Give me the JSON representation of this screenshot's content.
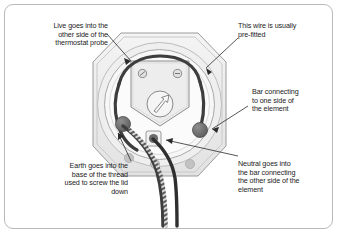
{
  "figure": {
    "frame_color": "#b9b9b9",
    "background": "#ffffff",
    "wire_color": "#4a4a4a",
    "plate_color": "#e8e8e8",
    "text_color": "#1b1b1b"
  },
  "callouts": [
    {
      "id": "live",
      "align": "right",
      "lines": [
        "Live goes into the",
        "other side of the",
        "thermostat probe"
      ],
      "text": "Live goes into the\nother side of the\nthermostat probe"
    },
    {
      "id": "prefitted",
      "align": "left",
      "lines": [
        "This wire is usually",
        "pre-fitted"
      ],
      "text": "This wire is usually\npre-fitted"
    },
    {
      "id": "bar-one-side",
      "align": "left",
      "lines": [
        "Bar connecting",
        "to one side of",
        "the element"
      ],
      "text": "Bar connecting\nto one side of\nthe element"
    },
    {
      "id": "neutral",
      "align": "left",
      "lines": [
        "Neutral goes into",
        "the bar connecting",
        "the other side of the",
        "element"
      ],
      "text": "Neutral goes into\nthe bar connecting\nthe other side of the\nelement"
    },
    {
      "id": "earth",
      "align": "right",
      "lines": [
        "Earth goes into the",
        "base of the thread",
        "used to screw the lid",
        "down"
      ],
      "text": "Earth goes into the\nbase of the thread\nused to screw the lid\ndown"
    }
  ],
  "diagram": {
    "parts": [
      {
        "name": "octagonal-backplate",
        "label": "octagonal back plate"
      },
      {
        "name": "outer-ring",
        "label": "outer ring"
      },
      {
        "name": "inner-ring",
        "label": "inner ring"
      },
      {
        "name": "terminal-block",
        "label": "terminal block"
      },
      {
        "name": "terminal-screw-left",
        "label": "left terminal screw"
      },
      {
        "name": "terminal-screw-right",
        "label": "right terminal screw"
      },
      {
        "name": "arrow-emblem",
        "label": "thermostat probe emblem"
      },
      {
        "name": "loop-wire",
        "label": "pre-fitted loop wire"
      },
      {
        "name": "bar-terminal-right",
        "label": "right bar terminal"
      },
      {
        "name": "bar-terminal-left",
        "label": "left bar terminal"
      },
      {
        "name": "square-terminal",
        "label": "square earth terminal"
      },
      {
        "name": "live-wire",
        "label": "live wire"
      },
      {
        "name": "neutral-wire",
        "label": "neutral wire"
      },
      {
        "name": "earth-wire",
        "label": "earth wire striped"
      }
    ]
  }
}
